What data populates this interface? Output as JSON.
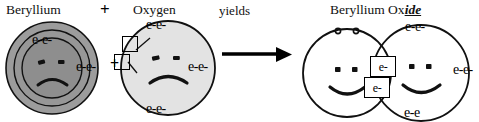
{
  "diagram": {
    "title_row": {
      "reactant1": "Beryllium",
      "plus": "+",
      "reactant2": "Oxygen",
      "yields": "yields",
      "product_prefix": "Beryllium Ox",
      "product_suffix": "ide"
    },
    "middle_plus": "+",
    "beryllium_atom": {
      "name": "beryllium-atom",
      "face": "frowning",
      "shell_outer_electrons": "e-e-",
      "valence_electrons": "e-e-",
      "fill_color": "#9a9a9a",
      "inner_fill_color": "#8f8f8f",
      "stroke_color": "#111111"
    },
    "oxygen_atom": {
      "name": "oxygen-atom",
      "face": "frowning",
      "top_electrons": "e-e-",
      "right_electrons": "e-e-",
      "bottom_electrons": "e-e-",
      "empty_slot_1": "",
      "empty_slot_2": "",
      "fill_color": "#e2e2e2",
      "stroke_color": "#111111"
    },
    "arrow": {
      "name": "yields-arrow",
      "color": "#000000"
    },
    "product": {
      "left_circle": {
        "name": "beryllium-ion-circle",
        "face": "smiling",
        "top_electrons": "e-e",
        "fill_color": "#ffffff",
        "stroke_color": "#111111"
      },
      "right_circle": {
        "name": "oxide-ion-circle",
        "face": "smiling",
        "top_electrons": "e-e-",
        "right_electrons": "e-e-",
        "bottom_electrons": "e-e",
        "fill_color": "#ffffff",
        "stroke_color": "#111111"
      },
      "shared_electron_1": "e-",
      "shared_electron_2": "e-"
    }
  }
}
